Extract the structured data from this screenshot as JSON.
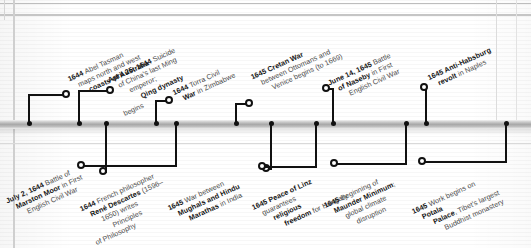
{
  "infographic": {
    "type": "historical-timeline",
    "orientation": "horizontal",
    "axis_label": "",
    "events_above": [
      {
        "id": "abel-tasman-australia",
        "date": "1644",
        "lines": [
          {
            "bold": "1644 ",
            "text": "Abel Tasman"
          },
          {
            "bold": "",
            "text": "maps north and west"
          },
          {
            "bold": "coasts of Australia",
            "text": ""
          }
        ],
        "dot_x": 28,
        "ring_x": 62,
        "ring_y": 91,
        "label_x": 72,
        "label_y": 74
      },
      {
        "id": "ming-emperor-suicide-qing",
        "date": "April 25, 1644",
        "lines": [
          {
            "bold": "April 25, 1644 ",
            "text": "Suicide"
          },
          {
            "bold": "",
            "text": "of China's last Ming"
          },
          {
            "bold": "",
            "text": "emperor; "
          },
          {
            "bold": "Qing dynasty",
            "text": ""
          },
          {
            "bold": "",
            "text": "begins"
          }
        ],
        "dot_x": 78,
        "ring_x": 106,
        "ring_y": 87,
        "label_x": 116,
        "label_y": 74
      },
      {
        "id": "torra-civil-war-zimbabwe",
        "date": "1644",
        "lines": [
          {
            "bold": "1644 ",
            "text": "Torra Civil"
          },
          {
            "bold": "War ",
            "text": "in Zimbabwe"
          }
        ],
        "dot_x": 155,
        "ring_x": 165,
        "ring_y": 97,
        "label_x": 175,
        "label_y": 88
      },
      {
        "id": "cretan-war-ottomans-venice",
        "date": "1645",
        "lines": [
          {
            "bold": "1645 Cretan War",
            "text": ""
          },
          {
            "bold": "",
            "text": "between Ottomans and"
          },
          {
            "bold": "",
            "text": "Venice begins (to 1669)"
          }
        ],
        "dot_x": 235,
        "ring_x": 245,
        "ring_y": 100,
        "label_x": 255,
        "label_y": 72
      },
      {
        "id": "battle-of-naseby",
        "date": "June 14, 1645",
        "lines": [
          {
            "bold": "June 14, 1645 ",
            "text": "Battle"
          },
          {
            "bold": "of Naseby ",
            "text": "in First"
          },
          {
            "bold": "",
            "text": "English Civil War"
          }
        ],
        "dot_x": 332,
        "ring_x": 322,
        "ring_y": 85,
        "label_x": 332,
        "label_y": 78
      },
      {
        "id": "anti-habsburg-revolt-naples",
        "date": "1645",
        "lines": [
          {
            "bold": "1645 Anti-Habsburg",
            "text": ""
          },
          {
            "bold": "revolt ",
            "text": "in Naples"
          }
        ],
        "dot_x": 425,
        "ring_x": 420,
        "ring_y": 84,
        "label_x": 430,
        "label_y": 73
      }
    ],
    "events_below": [
      {
        "id": "battle-of-marston-moor",
        "date": "July 2, 1644",
        "lines": [
          {
            "bold": "July 2, 1644 ",
            "text": "Battle of"
          },
          {
            "bold": "Marston Moor ",
            "text": "in First"
          },
          {
            "bold": "",
            "text": "English Civil War"
          }
        ],
        "dot_x": 105,
        "ring_x": 99,
        "ring_y": 168,
        "label_x": 10,
        "label_y": 196
      },
      {
        "id": "descartes-principles-philosophy",
        "date": "1644",
        "lines": [
          {
            "bold": "1644 ",
            "text": "French philosopher"
          },
          {
            "bold": "René Descartes ",
            "text": "(1596–"
          },
          {
            "bold": "",
            "text": "1650) writes "
          },
          {
            "bold": "",
            "text": "Principles"
          },
          {
            "bold": "",
            "text": "of Philosophy"
          }
        ],
        "dot_x": 175,
        "ring_x": 77,
        "ring_y": 162,
        "label_x": 88,
        "label_y": 203
      },
      {
        "id": "mughals-marathas-india",
        "date": "1645",
        "lines": [
          {
            "bold": "1645 ",
            "text": "War between"
          },
          {
            "bold": "Mughals and Hindu",
            "text": ""
          },
          {
            "bold": "Marathas ",
            "text": "in India"
          }
        ],
        "dot_x": 270,
        "ring_x": 262,
        "ring_y": 165,
        "label_x": 172,
        "label_y": 203
      },
      {
        "id": "peace-of-linz",
        "date": "1645",
        "lines": [
          {
            "bold": "1645 Peace of Linz",
            "text": ""
          },
          {
            "bold": "",
            "text": "guarantees "
          },
          {
            "bold": "religious",
            "text": ""
          },
          {
            "bold": "freedom ",
            "text": "for Hungary"
          }
        ],
        "dot_x": 315,
        "ring_x": 258,
        "ring_y": 163,
        "label_x": 258,
        "label_y": 202
      },
      {
        "id": "maunder-minimum",
        "date": "1645",
        "lines": [
          {
            "bold": "1645 ",
            "text": "Beginning of"
          },
          {
            "bold": "Maunder Minimum",
            "text": "; "
          },
          {
            "bold": "",
            "text": "global climate"
          },
          {
            "bold": "",
            "text": "disruption"
          }
        ],
        "dot_x": 405,
        "ring_x": 330,
        "ring_y": 160,
        "label_x": 330,
        "label_y": 200
      },
      {
        "id": "potala-palace-tibet",
        "date": "1645",
        "lines": [
          {
            "bold": "1645 ",
            "text": "Work begins on "
          },
          {
            "bold": "Potala",
            "text": ""
          },
          {
            "bold": "Palace",
            "text": ", Tibet's largest"
          },
          {
            "bold": "",
            "text": "Buddhist monastery"
          }
        ],
        "dot_x": 505,
        "ring_x": 418,
        "ring_y": 158,
        "label_x": 418,
        "label_y": 206
      }
    ],
    "axis_dots_x": [
      28,
      78,
      105,
      155,
      175,
      235,
      270,
      315,
      332,
      405,
      425,
      505
    ],
    "colors": {
      "bar": "#a8a8a8",
      "marker": "#111111",
      "bold_text": "#141414",
      "regular_text": "#4a4a4a",
      "background": "#ffffff"
    }
  }
}
